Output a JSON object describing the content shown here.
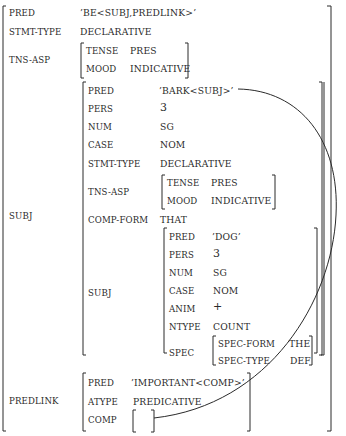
{
  "structure": {
    "outer": {
      "pred": {
        "label": "PRED",
        "value": "’BE<SUBJ,PREDLINK>’"
      },
      "stmt_type": {
        "label": "STMT-TYPE",
        "value": "DECLARATIVE"
      },
      "tns_asp": {
        "label": "TNS-ASP",
        "tense": {
          "label": "TENSE",
          "value": "PRES"
        },
        "mood": {
          "label": "MOOD",
          "value": "INDICATIVE"
        }
      },
      "subj_label": "SUBJ",
      "predlink_label": "PREDLINK"
    },
    "subj": {
      "pred": {
        "label": "PRED",
        "value": "’BARK<SUBJ>’"
      },
      "pers": {
        "label": "PERS",
        "value": "3"
      },
      "num": {
        "label": "NUM",
        "value": "SG"
      },
      "case": {
        "label": "CASE",
        "value": "NOM"
      },
      "stmt_type": {
        "label": "STMT-TYPE",
        "value": "DECLARATIVE"
      },
      "tns_asp": {
        "label": "TNS-ASP",
        "tense": {
          "label": "TENSE",
          "value": "PRES"
        },
        "mood": {
          "label": "MOOD",
          "value": "INDICATIVE"
        }
      },
      "comp_form": {
        "label": "COMP-FORM",
        "value": "THAT"
      },
      "subj_label": "SUBJ"
    },
    "dog": {
      "pred": {
        "label": "PRED",
        "value": "’DOG’"
      },
      "pers": {
        "label": "PERS",
        "value": "3"
      },
      "num": {
        "label": "NUM",
        "value": "SG"
      },
      "case": {
        "label": "CASE",
        "value": "NOM"
      },
      "anim": {
        "label": "ANIM",
        "value": "+"
      },
      "ntype": {
        "label": "NTYPE",
        "value": "COUNT"
      },
      "spec": {
        "label": "SPEC",
        "spec_form": {
          "label": "SPEC-FORM",
          "value": "THE"
        },
        "spec_type": {
          "label": "SPEC-TYPE",
          "value": "DEF"
        }
      }
    },
    "predlink": {
      "pred": {
        "label": "PRED",
        "value": "’IMPORTANT<COMP>’"
      },
      "atype": {
        "label": "ATYPE",
        "value": "PREDICATIVE"
      },
      "comp": {
        "label": "COMP",
        "value": ""
      }
    }
  },
  "colors": {
    "ink": "#2a2a2a",
    "background": "#ffffff"
  }
}
